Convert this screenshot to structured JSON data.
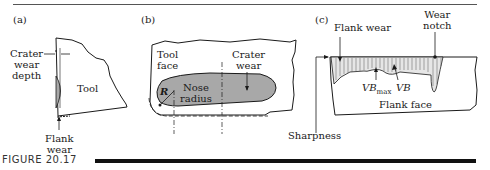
{
  "figure": {
    "caption": "FIGURE 20.17",
    "panels": [
      {
        "id": "a",
        "label": "(a)",
        "labels": {
          "crater_wear_depth": [
            "Crater",
            "wear",
            "depth"
          ],
          "tool": "Tool",
          "flank_wear": [
            "Flank",
            "wear"
          ]
        }
      },
      {
        "id": "b",
        "label": "(b)",
        "labels": {
          "tool_face": [
            "Tool",
            "face"
          ],
          "crater_wear": [
            "Crater",
            "wear"
          ],
          "nose_radius": [
            "Nose",
            "radius"
          ],
          "radius_symbol": "R"
        }
      },
      {
        "id": "c",
        "label": "(c)",
        "labels": {
          "flank_wear": "Flank wear",
          "wear_notch": [
            "Wear",
            "notch"
          ],
          "vb_max": "VB",
          "vb_max_sub": "max",
          "vb": "VB",
          "flank_face": "Flank face",
          "sharpness": "Sharpness"
        }
      }
    ],
    "colors": {
      "line": "#1a1a1a",
      "crater_fill": "#a8a8a8",
      "caption_bar": "#111111"
    }
  }
}
